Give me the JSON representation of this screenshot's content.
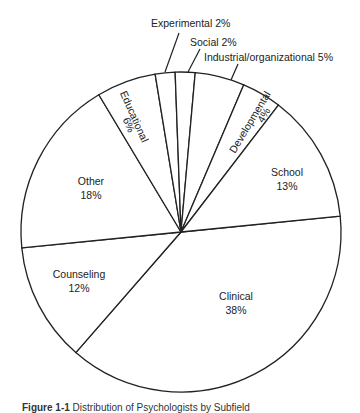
{
  "chart_data": {
    "type": "pie",
    "title": "",
    "start_angle_deg": -5.7,
    "direction": "clockwise",
    "slices": [
      {
        "label": "Clinical",
        "value": 38,
        "display": "38%"
      },
      {
        "label": "Counseling",
        "value": 12,
        "display": "12%"
      },
      {
        "label": "Other",
        "value": 18,
        "display": "18%"
      },
      {
        "label": "Educational",
        "value": 6,
        "display": "6%"
      },
      {
        "label": "Experimental",
        "value": 2,
        "display": "Experimental 2%"
      },
      {
        "label": "Social",
        "value": 2,
        "display": "Social 2%"
      },
      {
        "label": "Industrial/organizational",
        "value": 5,
        "display": "Industrial/organizational 5%"
      },
      {
        "label": "Developmental",
        "value": 4,
        "display": "4%"
      },
      {
        "label": "School",
        "value": 13,
        "display": "13%"
      }
    ],
    "fill": "#ffffff",
    "stroke": "#222222",
    "legend": "none (labels inside slices / leader lines)"
  },
  "labels": {
    "clinical": {
      "name": "Clinical",
      "pct": "38%"
    },
    "counseling": {
      "name": "Counseling",
      "pct": "12%"
    },
    "other": {
      "name": "Other",
      "pct": "18%"
    },
    "educational": {
      "name": "Educational",
      "pct": "6%"
    },
    "experimental": "Experimental 2%",
    "social": "Social 2%",
    "industrial": "Industrial/organizational 5%",
    "developmental": {
      "name": "Developmental",
      "pct": "4%"
    },
    "school": {
      "name": "School",
      "pct": "13%"
    }
  },
  "caption": {
    "prefix": "Figure 1-1",
    "text": "Distribution of Psychologists by Subfield"
  }
}
